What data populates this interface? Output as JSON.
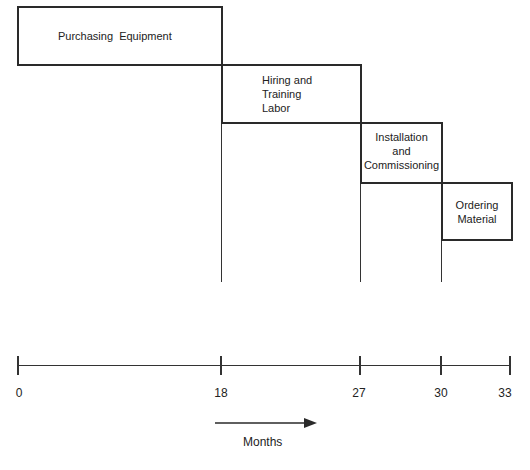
{
  "diagram": {
    "type": "gantt-schedule",
    "tasks": [
      {
        "label": "Purchasing  Equipment",
        "lines": [
          "Purchasing  Equipment"
        ],
        "start": 0,
        "end": 18
      },
      {
        "label": "Hiring and Training Labor",
        "lines": [
          "Hiring and",
          "Training",
          "Labor"
        ],
        "start": 18,
        "end": 27
      },
      {
        "label": "Installation and Commissioning",
        "lines": [
          "Installation",
          "and",
          "Commissioning"
        ],
        "start": 27,
        "end": 30
      },
      {
        "label": "Ordering Material",
        "lines": [
          "Ordering",
          "Material"
        ],
        "start": 30,
        "end": 33
      }
    ],
    "axis": {
      "ticks": [
        "0",
        "18",
        "27",
        "30",
        "33"
      ],
      "unit_label": "Months",
      "direction": "arrow-right"
    },
    "colors": {
      "line": "#2a2a2a",
      "background": "#ffffff"
    }
  }
}
